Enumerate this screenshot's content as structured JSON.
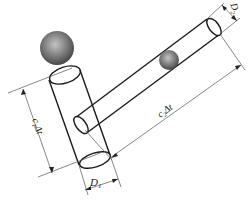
{
  "diagram": {
    "labels": {
      "d1": "D",
      "d1_sub": "1",
      "d2": "D",
      "d2_sub": "2",
      "len1_c": "c",
      "len1_sub": "1",
      "len1_dt": "Δt",
      "len2_c": "c",
      "len2_sub": "2",
      "len2_dt": "Δt"
    },
    "colors": {
      "line": "#1a1a1a",
      "dim_line": "#555555",
      "sphere_light": "#b8b8b8",
      "sphere_dark": "#4a4a4a"
    }
  }
}
